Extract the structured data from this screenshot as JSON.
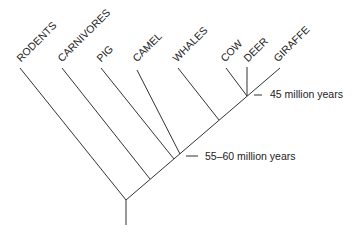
{
  "diagram": {
    "type": "phylogenetic-tree",
    "taxa": [
      "RODENTS",
      "CARNIVORES",
      "PIG",
      "CAMEL",
      "WHALES",
      "COW",
      "DEER",
      "GIRAFFE"
    ],
    "annotations": {
      "ruminant_split": "45 million years",
      "artiodactyl_split": "55–60 million years"
    }
  }
}
